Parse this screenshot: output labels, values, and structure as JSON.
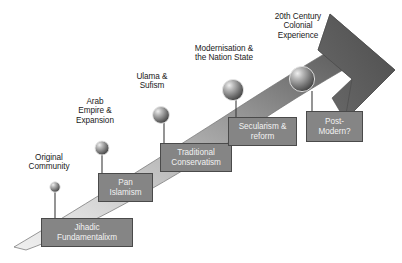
{
  "diagram": {
    "type": "curved-arrow-timeline",
    "colors": {
      "arrow_light": "#d9d9d9",
      "arrow_dark": "#585858",
      "arrowhead": "#585858",
      "box_fill": "#858585",
      "box_border": "#4a4a4a",
      "box_text": "#f2f2f2",
      "stage_text": "#1a1a1a",
      "background": "#ffffff",
      "sphere_light": "#e8e8e8",
      "sphere_dark": "#4f4f4f"
    },
    "stages": [
      {
        "id": "original-community",
        "label": "Original\nCommunity",
        "label_x": 16,
        "label_y": 153,
        "label_w": 66,
        "node_cx": 55,
        "node_cy": 187,
        "node_r": 5.2
      },
      {
        "id": "arab-empire-expansion",
        "label": "Arab\nEmpire &\nExpansion",
        "label_x": 64,
        "label_y": 97,
        "label_w": 62,
        "node_cx": 102,
        "node_cy": 148,
        "node_r": 7.0
      },
      {
        "id": "ulama-sufism",
        "label": "Ulama &\nSufism",
        "label_x": 126,
        "label_y": 72,
        "label_w": 52,
        "node_cx": 161,
        "node_cy": 115,
        "node_r": 8.4
      },
      {
        "id": "modernisation-nation-state",
        "label": "Modernisation &\nthe Nation State",
        "label_x": 178,
        "label_y": 44,
        "label_w": 92,
        "node_cx": 233,
        "node_cy": 90,
        "node_r": 10.6
      },
      {
        "id": "20th-century-colonial-experience",
        "label": "20th Century\nColonial\nExperience",
        "label_x": 258,
        "label_y": 12,
        "label_w": 80,
        "node_cx": 302,
        "node_cy": 79,
        "node_r": 12.6
      }
    ],
    "movements": [
      {
        "id": "jihadic-fundamentalism",
        "label": "Jihadic\nFundamentalixm",
        "box_x": 41,
        "box_y": 218,
        "box_w": 92,
        "box_h": 29,
        "connector_x": 55,
        "connector_y1": 192,
        "connector_y2": 218
      },
      {
        "id": "pan-islamism",
        "label": "Pan\nIslamism",
        "box_x": 98,
        "box_y": 173,
        "box_w": 55,
        "box_h": 29,
        "connector_x": 102,
        "connector_y1": 155,
        "connector_y2": 173
      },
      {
        "id": "traditional-conservatism",
        "label": "Traditional\nConservatism",
        "box_x": 160,
        "box_y": 143,
        "box_w": 72,
        "box_h": 29,
        "connector_x": 164,
        "connector_y1": 123,
        "connector_y2": 143
      },
      {
        "id": "secularism-reform",
        "label": "Secularism &\nreform",
        "box_x": 228,
        "box_y": 117,
        "box_w": 69,
        "box_h": 29,
        "connector_x": 236,
        "connector_y1": 100,
        "connector_y2": 117
      },
      {
        "id": "post-modern",
        "label": "Post-\nModern?",
        "box_x": 306,
        "box_y": 111,
        "box_w": 57,
        "box_h": 31,
        "connector_x": 312,
        "connector_y1": 91,
        "connector_y2": 111
      }
    ]
  }
}
